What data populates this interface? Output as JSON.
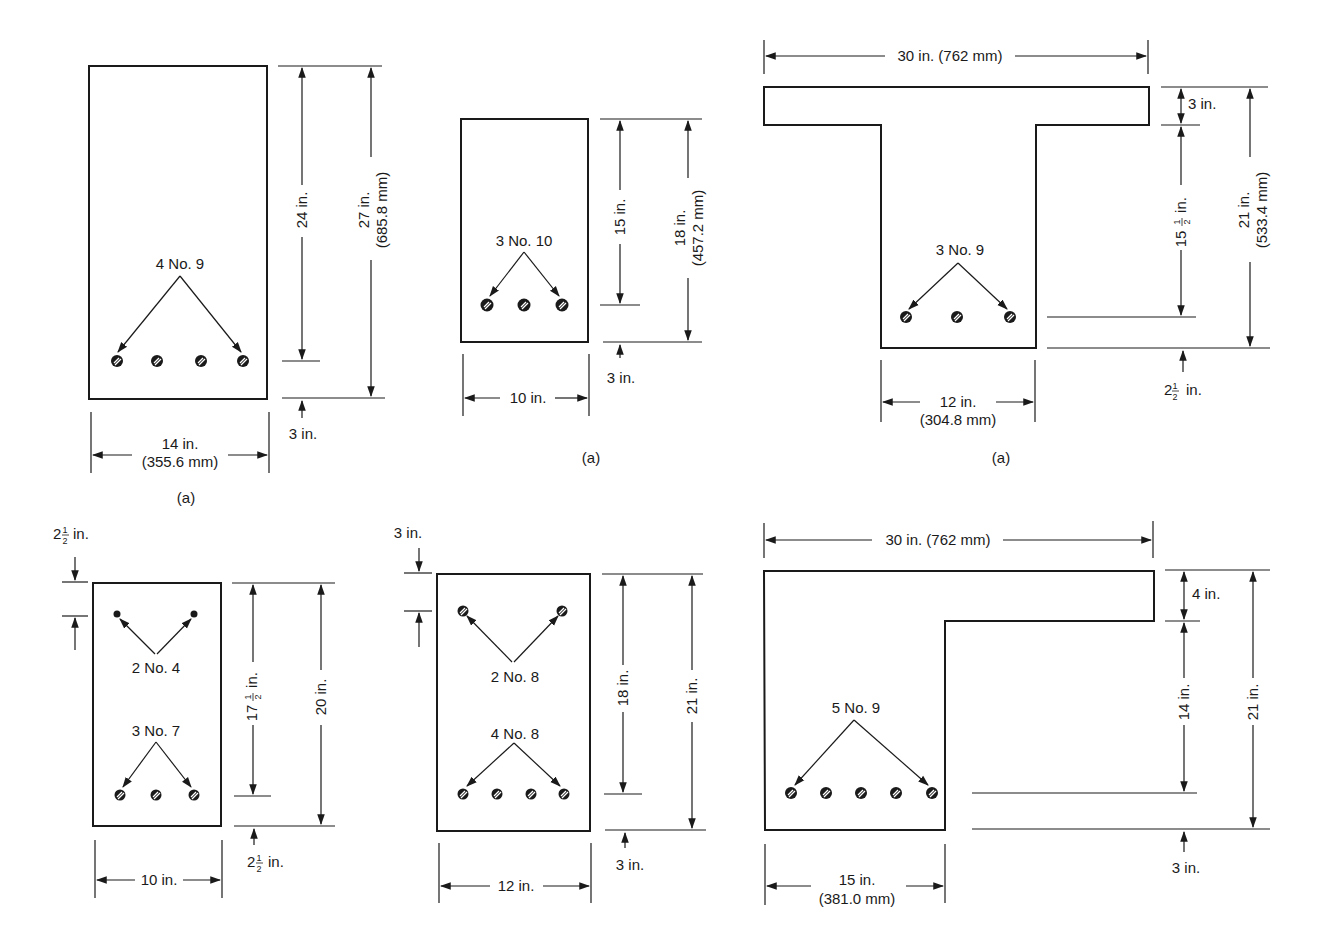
{
  "figure": {
    "colors": {
      "ink": "#1a1a1a",
      "background": "#ffffff"
    }
  },
  "sections": [
    {
      "id": "rect-14x27",
      "shape": "rectangular",
      "caption": "(a)",
      "rebar_label": "4 No. 9",
      "bar_count": 4,
      "width_label": "14 in.",
      "width_label_mm": "(355.6 mm)",
      "effective_depth_label": "24 in.",
      "total_depth_label": "27 in.",
      "total_depth_label_mm": "(685.8 mm)",
      "cover_label": "3 in."
    },
    {
      "id": "rect-10x18",
      "shape": "rectangular",
      "caption": "(a)",
      "rebar_label": "3 No. 10",
      "bar_count": 3,
      "width_label": "10 in.",
      "effective_depth_label": "15 in.",
      "total_depth_label": "18 in.",
      "total_depth_label_mm": "(457.2 mm)",
      "cover_label": "3 in."
    },
    {
      "id": "tee-30x21",
      "shape": "T-beam",
      "caption": "(a)",
      "rebar_label": "3 No. 9",
      "bar_count": 3,
      "flange_width_label": "30 in. (762 mm)",
      "flange_thickness_label": "3 in.",
      "web_depth_label_whole": "15",
      "web_depth_label_frac": "1/2",
      "web_depth_unit": "in.",
      "total_depth_label": "21 in.",
      "total_depth_label_mm": "(533.4 mm)",
      "cover_label_whole": "2",
      "cover_label_frac": "1/2",
      "cover_unit": "in.",
      "web_width_label": "12 in.",
      "web_width_label_mm": "(304.8 mm)"
    },
    {
      "id": "doubly-10x20",
      "shape": "rectangular-doubly-reinforced",
      "top_rebar_label": "2 No. 4",
      "bottom_rebar_label": "3 No. 7",
      "top_cover_whole": "2",
      "top_cover_frac": "1/2",
      "top_cover_unit": "in.",
      "effective_depth_whole": "17",
      "effective_depth_frac": "1/2",
      "effective_depth_unit": "in.",
      "total_depth_label": "20 in.",
      "bottom_cover_whole": "2",
      "bottom_cover_frac": "1/2",
      "bottom_cover_unit": "in.",
      "width_label": "10 in."
    },
    {
      "id": "doubly-12x21",
      "shape": "rectangular-doubly-reinforced",
      "top_rebar_label": "2 No. 8",
      "bottom_rebar_label": "4 No. 8",
      "top_cover_label": "3 in.",
      "effective_depth_label": "18 in.",
      "total_depth_label": "21 in.",
      "bottom_cover_label": "3 in.",
      "width_label": "12 in."
    },
    {
      "id": "ell-30x21",
      "shape": "L-beam",
      "rebar_label": "5 No. 9",
      "bar_count": 5,
      "flange_width_label": "30 in. (762 mm)",
      "flange_thickness_label": "4 in.",
      "web_depth_label": "14 in.",
      "total_depth_label": "21 in.",
      "cover_label": "3 in.",
      "web_width_label": "15 in.",
      "web_width_label_mm": "(381.0 mm)"
    }
  ]
}
